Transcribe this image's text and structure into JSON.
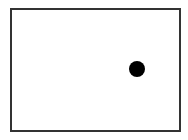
{
  "canvas": {
    "background": "#ffffff",
    "frame_border_color": "#333333"
  },
  "dot": {
    "color": "#000000",
    "center_x": 137,
    "center_y": 69,
    "diameter": 16
  }
}
